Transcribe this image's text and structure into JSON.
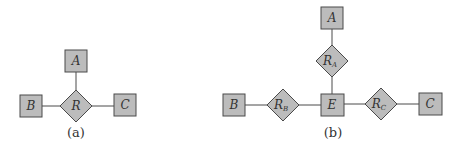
{
  "diagram_a": {
    "caption": "(a)",
    "entities": [
      {
        "id": "A",
        "label": "A"
      },
      {
        "id": "B",
        "label": "B"
      },
      {
        "id": "C",
        "label": "C"
      }
    ],
    "relationships": [
      {
        "id": "R",
        "label": "R",
        "connects": [
          "A",
          "B",
          "C"
        ]
      }
    ]
  },
  "diagram_b": {
    "caption": "(b)",
    "entities": [
      {
        "id": "A",
        "label": "A"
      },
      {
        "id": "B",
        "label": "B"
      },
      {
        "id": "E",
        "label": "E"
      },
      {
        "id": "C",
        "label": "C"
      }
    ],
    "relationships": [
      {
        "id": "RA",
        "label": "R",
        "sub": "A",
        "connects": [
          "E",
          "A"
        ]
      },
      {
        "id": "RB",
        "label": "R",
        "sub": "B",
        "connects": [
          "E",
          "B"
        ]
      },
      {
        "id": "RC",
        "label": "R",
        "sub": "C",
        "connects": [
          "E",
          "C"
        ]
      }
    ]
  },
  "colors": {
    "shape_fill": "#bcbcbc",
    "stroke": "#4a4a4a"
  }
}
